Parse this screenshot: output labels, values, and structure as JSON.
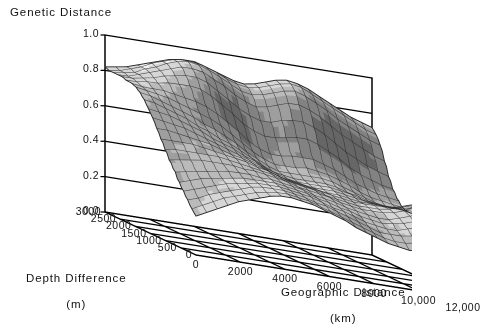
{
  "chart_data": {
    "type": "surface",
    "title": "Genetic Distance",
    "zlabel": "Genetic Distance",
    "xlabel": "Geographic Distance",
    "xunits": "(km)",
    "ylabel": "Depth Difference",
    "yunits": "(m)",
    "zlim": [
      0.0,
      1.0
    ],
    "xlim": [
      0,
      12000
    ],
    "ylim": [
      0,
      3000
    ],
    "grid": true,
    "legend": "none",
    "z_ticks": [
      "1.0",
      "0.8",
      "0.6",
      "0.4",
      "0.2",
      "0.0"
    ],
    "z_tick_values": [
      1.0,
      0.8,
      0.6,
      0.4,
      0.2,
      0.0
    ],
    "x_ticks": [
      "0",
      "2000",
      "4000",
      "6000",
      "8000",
      "10,000",
      "12,000"
    ],
    "x_tick_values": [
      0,
      2000,
      4000,
      6000,
      8000,
      10000,
      12000
    ],
    "y_ticks": [
      "3000",
      "2500",
      "2000",
      "1500",
      "1000",
      "500",
      "0"
    ],
    "y_tick_values": [
      3000,
      2500,
      2000,
      1500,
      1000,
      500,
      0
    ],
    "x_grid_divisions": 6,
    "y_grid_divisions": 6,
    "surface_color_light": "#f2f2f2",
    "surface_color_dark": "#4a4a4a",
    "mesh_line_color": "#2b2b2b",
    "axis_color": "#000000",
    "background": "#ffffff",
    "mesh_nx": 26,
    "mesh_ny": 22,
    "surface_description": "Smooth interpolated genetic-distance surface: high ridge near 0.9 along the far (large depth difference) edge at mid geographic distance, a broad light plateau at ~0.45-0.6 in the center, a steep dark drop toward the front-right, and an isolated rounded lobe at ~0.35 near 11,000 km with small depth difference.",
    "z_grid": [
      [
        0.82,
        0.83,
        0.84,
        0.86,
        0.88,
        0.9,
        0.92,
        0.93,
        0.93,
        0.92,
        0.9,
        0.88,
        0.86,
        0.85,
        0.86,
        0.88,
        0.9,
        0.91,
        0.9,
        0.88,
        0.85,
        0.82,
        0.79,
        0.76,
        0.74,
        0.72
      ],
      [
        0.81,
        0.82,
        0.84,
        0.86,
        0.89,
        0.91,
        0.93,
        0.94,
        0.94,
        0.92,
        0.9,
        0.87,
        0.85,
        0.84,
        0.85,
        0.87,
        0.89,
        0.9,
        0.89,
        0.86,
        0.83,
        0.8,
        0.77,
        0.74,
        0.71,
        0.69
      ],
      [
        0.81,
        0.82,
        0.83,
        0.86,
        0.88,
        0.91,
        0.93,
        0.94,
        0.93,
        0.91,
        0.88,
        0.85,
        0.82,
        0.81,
        0.82,
        0.84,
        0.86,
        0.87,
        0.85,
        0.82,
        0.79,
        0.75,
        0.72,
        0.69,
        0.66,
        0.64
      ],
      [
        0.81,
        0.81,
        0.83,
        0.85,
        0.87,
        0.89,
        0.91,
        0.91,
        0.9,
        0.87,
        0.84,
        0.8,
        0.77,
        0.75,
        0.76,
        0.78,
        0.8,
        0.8,
        0.78,
        0.75,
        0.71,
        0.67,
        0.64,
        0.61,
        0.58,
        0.56
      ],
      [
        0.81,
        0.81,
        0.82,
        0.83,
        0.85,
        0.86,
        0.87,
        0.87,
        0.85,
        0.81,
        0.77,
        0.73,
        0.7,
        0.68,
        0.68,
        0.7,
        0.71,
        0.71,
        0.69,
        0.66,
        0.62,
        0.58,
        0.55,
        0.52,
        0.5,
        0.48
      ],
      [
        0.8,
        0.8,
        0.81,
        0.81,
        0.82,
        0.82,
        0.82,
        0.81,
        0.78,
        0.74,
        0.7,
        0.65,
        0.62,
        0.6,
        0.6,
        0.61,
        0.62,
        0.62,
        0.6,
        0.57,
        0.54,
        0.5,
        0.47,
        0.45,
        0.43,
        0.42
      ],
      [
        0.8,
        0.79,
        0.79,
        0.79,
        0.78,
        0.77,
        0.76,
        0.74,
        0.71,
        0.67,
        0.63,
        0.58,
        0.55,
        0.53,
        0.53,
        0.54,
        0.54,
        0.54,
        0.52,
        0.5,
        0.47,
        0.44,
        0.42,
        0.4,
        0.39,
        0.38
      ],
      [
        0.79,
        0.78,
        0.77,
        0.76,
        0.74,
        0.72,
        0.7,
        0.68,
        0.65,
        0.61,
        0.57,
        0.53,
        0.5,
        0.48,
        0.48,
        0.48,
        0.49,
        0.48,
        0.47,
        0.45,
        0.43,
        0.4,
        0.38,
        0.37,
        0.36,
        0.35
      ],
      [
        0.77,
        0.76,
        0.74,
        0.72,
        0.7,
        0.68,
        0.65,
        0.63,
        0.6,
        0.57,
        0.53,
        0.5,
        0.47,
        0.45,
        0.45,
        0.45,
        0.45,
        0.45,
        0.44,
        0.42,
        0.4,
        0.38,
        0.36,
        0.35,
        0.35,
        0.34
      ],
      [
        0.74,
        0.73,
        0.71,
        0.69,
        0.67,
        0.64,
        0.62,
        0.59,
        0.57,
        0.54,
        0.51,
        0.48,
        0.45,
        0.44,
        0.43,
        0.43,
        0.43,
        0.43,
        0.42,
        0.4,
        0.39,
        0.37,
        0.36,
        0.35,
        0.35,
        0.34
      ],
      [
        0.7,
        0.69,
        0.68,
        0.66,
        0.64,
        0.62,
        0.59,
        0.57,
        0.55,
        0.52,
        0.5,
        0.47,
        0.45,
        0.43,
        0.42,
        0.42,
        0.42,
        0.42,
        0.41,
        0.4,
        0.38,
        0.37,
        0.36,
        0.36,
        0.36,
        0.36
      ],
      [
        0.66,
        0.65,
        0.64,
        0.63,
        0.61,
        0.59,
        0.57,
        0.55,
        0.53,
        0.51,
        0.49,
        0.46,
        0.44,
        0.43,
        0.42,
        0.41,
        0.41,
        0.41,
        0.4,
        0.39,
        0.38,
        0.37,
        0.37,
        0.37,
        0.38,
        0.38
      ],
      [
        0.61,
        0.61,
        0.6,
        0.59,
        0.58,
        0.57,
        0.55,
        0.53,
        0.52,
        0.5,
        0.48,
        0.46,
        0.44,
        0.43,
        0.42,
        0.41,
        0.4,
        0.4,
        0.39,
        0.38,
        0.38,
        0.38,
        0.38,
        0.39,
        0.4,
        0.41
      ],
      [
        0.56,
        0.56,
        0.56,
        0.56,
        0.55,
        0.54,
        0.53,
        0.52,
        0.51,
        0.49,
        0.48,
        0.46,
        0.44,
        0.43,
        0.42,
        0.41,
        0.4,
        0.39,
        0.38,
        0.38,
        0.38,
        0.38,
        0.39,
        0.41,
        0.43,
        0.44
      ],
      [
        0.51,
        0.52,
        0.52,
        0.52,
        0.52,
        0.52,
        0.51,
        0.5,
        0.49,
        0.48,
        0.47,
        0.45,
        0.44,
        0.43,
        0.42,
        0.4,
        0.39,
        0.38,
        0.37,
        0.37,
        0.37,
        0.38,
        0.4,
        0.42,
        0.44,
        0.46
      ],
      [
        0.46,
        0.47,
        0.48,
        0.49,
        0.49,
        0.49,
        0.49,
        0.48,
        0.48,
        0.47,
        0.46,
        0.45,
        0.43,
        0.42,
        0.41,
        0.4,
        0.38,
        0.37,
        0.36,
        0.36,
        0.36,
        0.37,
        0.39,
        0.42,
        0.44,
        0.46
      ],
      [
        0.42,
        0.43,
        0.44,
        0.45,
        0.46,
        0.47,
        0.47,
        0.47,
        0.46,
        0.46,
        0.45,
        0.44,
        0.43,
        0.41,
        0.4,
        0.39,
        0.37,
        0.36,
        0.35,
        0.34,
        0.34,
        0.36,
        0.38,
        0.41,
        0.43,
        0.45
      ],
      [
        0.37,
        0.39,
        0.41,
        0.42,
        0.43,
        0.44,
        0.45,
        0.45,
        0.45,
        0.45,
        0.44,
        0.43,
        0.42,
        0.4,
        0.39,
        0.37,
        0.36,
        0.34,
        0.33,
        0.32,
        0.33,
        0.34,
        0.36,
        0.39,
        0.41,
        0.42
      ],
      [
        0.33,
        0.35,
        0.37,
        0.39,
        0.41,
        0.42,
        0.43,
        0.44,
        0.44,
        0.44,
        0.43,
        0.42,
        0.41,
        0.39,
        0.37,
        0.36,
        0.34,
        0.32,
        0.31,
        0.3,
        0.3,
        0.32,
        0.34,
        0.36,
        0.38,
        0.39
      ],
      [
        0.29,
        0.31,
        0.34,
        0.36,
        0.38,
        0.4,
        0.42,
        0.43,
        0.43,
        0.43,
        0.42,
        0.41,
        0.39,
        0.38,
        0.36,
        0.34,
        0.32,
        0.3,
        0.28,
        0.28,
        0.28,
        0.29,
        0.31,
        0.33,
        0.34,
        0.35
      ],
      [
        0.25,
        0.28,
        0.31,
        0.34,
        0.36,
        0.38,
        0.4,
        0.41,
        0.42,
        0.42,
        0.41,
        0.4,
        0.38,
        0.36,
        0.34,
        0.32,
        0.3,
        0.28,
        0.26,
        0.25,
        0.25,
        0.26,
        0.27,
        0.29,
        0.3,
        0.31
      ],
      [
        0.22,
        0.25,
        0.28,
        0.31,
        0.34,
        0.36,
        0.38,
        0.4,
        0.41,
        0.41,
        0.4,
        0.39,
        0.37,
        0.35,
        0.33,
        0.3,
        0.28,
        0.26,
        0.24,
        0.23,
        0.22,
        0.23,
        0.24,
        0.25,
        0.26,
        0.27
      ]
    ]
  },
  "labels": {
    "title": "Genetic Distance",
    "depth_axis_line1": "Depth Difference",
    "depth_axis_line2": "(m)",
    "geo_axis_line1": "Geographic Distance",
    "geo_axis_line2": "(km)"
  }
}
